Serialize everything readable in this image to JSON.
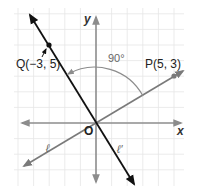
{
  "diagram": {
    "axes": {
      "x_label": "x",
      "y_label": "y",
      "origin_label": "O"
    },
    "points": [
      {
        "name": "Q",
        "coords": "(−3, 5)",
        "label": "Q(−3, 5)"
      },
      {
        "name": "P",
        "coords": "(5, 3)",
        "label": "P(5, 3)"
      }
    ],
    "lines": [
      {
        "name": "ell",
        "label": "ℓ",
        "through": "O and P(5, 3)"
      },
      {
        "name": "ell-prime",
        "label": "ℓ′",
        "through": "O and Q(−3, 5)"
      }
    ],
    "angle": {
      "label": "90°",
      "from": "ℓ",
      "to": "ℓ′"
    },
    "colors": {
      "grid": "#e6e6e6",
      "axis": "#8c8c8c",
      "line_l": "#7a7a7a",
      "line_lprime": "#111111",
      "arc": "#8c8c8c"
    }
  }
}
